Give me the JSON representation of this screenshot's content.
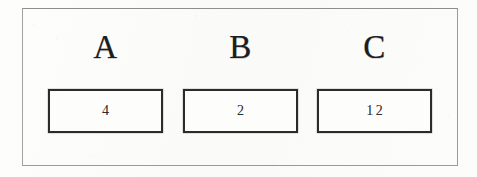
{
  "diagram": {
    "style": {
      "background_color": "#fcfcfb",
      "frame_border_color": "#9a9a9a",
      "box_border_color": "#2b2b2b",
      "label_color": "#1d1d1d",
      "value_color": "#2e2e2e"
    },
    "frame": {
      "name": "outer-frame"
    },
    "columns": [
      {
        "label": "A",
        "value": "4"
      },
      {
        "label": "B",
        "value": "2"
      },
      {
        "label": "C",
        "value": "12"
      }
    ]
  }
}
